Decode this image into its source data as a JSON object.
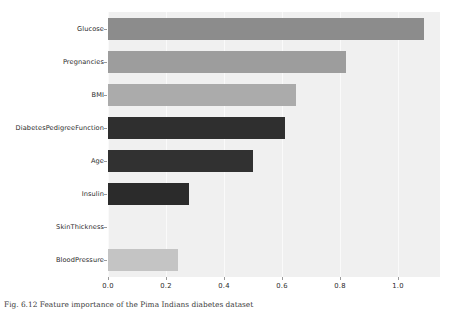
{
  "figure": {
    "caption": "Fig. 6.12  Feature importance of the Pima Indians diabetes dataset"
  },
  "chart_data": {
    "type": "bar",
    "orientation": "horizontal",
    "title": "",
    "xlabel": "",
    "ylabel": "",
    "categories": [
      "Glucose",
      "Pregnancies",
      "BMI",
      "DiabetesPedigreeFunction",
      "Age",
      "Insulin",
      "SkinThickness",
      "BloodPressure"
    ],
    "values": [
      1.09,
      0.82,
      0.65,
      0.61,
      0.5,
      0.28,
      0.0,
      0.24
    ],
    "colors": [
      "#8c8c8c",
      "#9d9d9d",
      "#ababab",
      "#2f2f2f",
      "#313131",
      "#2b2b2b",
      "#f0f0f0",
      "#c4c4c4"
    ],
    "xlim": [
      0.0,
      1.145
    ],
    "xticks": [
      0.0,
      0.2,
      0.4,
      0.6,
      0.8,
      1.0
    ],
    "xticklabels": [
      "0.0",
      "0.2",
      "0.4",
      "0.6",
      "0.8",
      "1.0"
    ],
    "grid": true,
    "grid_axis": "x",
    "grid_color": "#fafafa",
    "plot_background": "#f0f0f0",
    "figure_background": "#ffffff",
    "legend": null
  }
}
